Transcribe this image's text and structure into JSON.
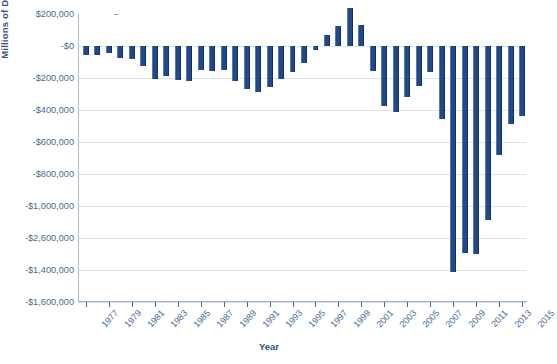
{
  "chart_data": {
    "type": "bar",
    "title": "",
    "xlabel": "Year",
    "ylabel": "Millions of Dollars",
    "ylim": [
      -1600000,
      200000
    ],
    "grid": true,
    "legend_position": "none",
    "y_tick_labels": [
      "$200,000",
      "-$0",
      "-$200,000",
      "-$400,000",
      "-$600,000",
      "-$800,000",
      "-$1,000,000",
      "-$2,600,000",
      "-$1,400,000",
      "-$1,600,000"
    ],
    "y_tick_values": [
      200000,
      0,
      -200000,
      -400000,
      -600000,
      -800000,
      -1000000,
      -1200000,
      -1400000,
      -1600000
    ],
    "x_tick_labels": [
      "1977",
      "1979",
      "1981",
      "1983",
      "1985",
      "1987",
      "1989",
      "1991",
      "1993",
      "1995",
      "1997",
      "1999",
      "2001",
      "2003",
      "2005",
      "2007",
      "2009",
      "2011",
      "2013",
      "2015"
    ],
    "categories": [
      1977,
      1978,
      1979,
      1980,
      1981,
      1982,
      1983,
      1984,
      1985,
      1986,
      1987,
      1988,
      1989,
      1990,
      1991,
      1992,
      1993,
      1994,
      1995,
      1996,
      1997,
      1998,
      1999,
      2000,
      2001,
      2002,
      2003,
      2004,
      2005,
      2006,
      2007,
      2008,
      2009,
      2010,
      2011,
      2012,
      2013,
      2014,
      2015
    ],
    "values": [
      -53659,
      -59186,
      -40726,
      -73830,
      -78976,
      -127977,
      -207802,
      -185367,
      -212308,
      -221227,
      -149730,
      -155178,
      -152639,
      -221036,
      -269238,
      -290321,
      -255051,
      -203186,
      -163952,
      -107431,
      -21884,
      69270,
      125610,
      236241,
      128236,
      -157758,
      -377585,
      -412727,
      -318346,
      -248181,
      -160701,
      -458553,
      -1412688,
      -1294373,
      -1299593,
      -1086963,
      -679544,
      -484793,
      -438496
    ],
    "series_name": "Federal Surplus or Deficit",
    "bar_color": "#21498A",
    "axis_text_color": "#4A6C94",
    "axis_title_color": "#35567F",
    "gridline_color": "#DFE3EA"
  },
  "axis": {
    "y_title": "Millions of Dollars",
    "x_title": "Year"
  },
  "caption": ""
}
